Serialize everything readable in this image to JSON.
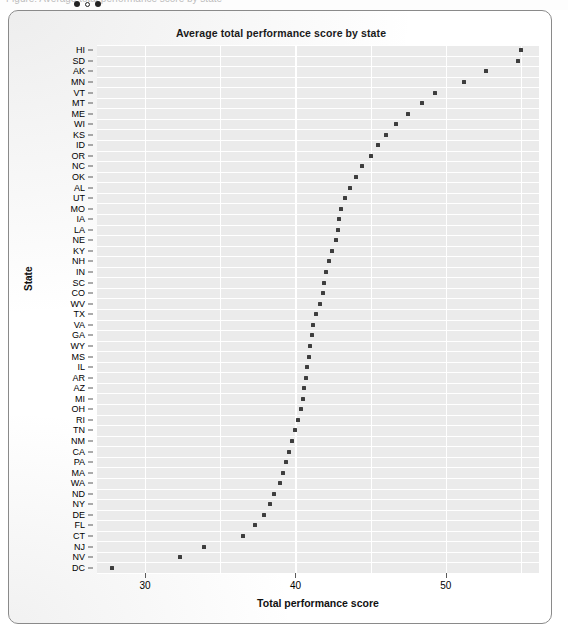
{
  "chrome": {
    "ghost_text": "Figure: Average total performance score by state",
    "dots": [
      "filled",
      "hollow",
      "filled"
    ]
  },
  "chart_data": {
    "type": "scatter",
    "title": "Average total performance score by state",
    "xlabel": "Total performance score",
    "ylabel": "State",
    "xlim": [
      26.8,
      56.2
    ],
    "xticks": [
      30,
      40,
      50
    ],
    "xtick_labels": [
      "30",
      "40",
      "50"
    ],
    "grid": true,
    "legend": null,
    "orientation": "horizontal-dot-plot",
    "categories": [
      "HI",
      "SD",
      "AK",
      "MN",
      "VT",
      "MT",
      "ME",
      "WI",
      "KS",
      "ID",
      "OR",
      "NC",
      "OK",
      "AL",
      "UT",
      "MO",
      "IA",
      "LA",
      "NE",
      "NH",
      "KY",
      "IN",
      "SC",
      "CO",
      "WV",
      "TX",
      "VA",
      "GA",
      "WY",
      "MS",
      "IL",
      "AR",
      "AZ",
      "MI",
      "OH",
      "RI",
      "TN",
      "NM",
      "CA",
      "PA",
      "MA",
      "WA",
      "ND",
      "NY",
      "DE",
      "FL",
      "CT",
      "NJ",
      "NV",
      "DC"
    ],
    "points": [
      {
        "state": "HI",
        "value": 55.0
      },
      {
        "state": "SD",
        "value": 54.8
      },
      {
        "state": "AK",
        "value": 52.7
      },
      {
        "state": "MN",
        "value": 51.2
      },
      {
        "state": "VT",
        "value": 49.3
      },
      {
        "state": "MT",
        "value": 48.4
      },
      {
        "state": "ME",
        "value": 47.5
      },
      {
        "state": "WI",
        "value": 46.7
      },
      {
        "state": "KS",
        "value": 46.0
      },
      {
        "state": "ID",
        "value": 45.5
      },
      {
        "state": "OR",
        "value": 45.0
      },
      {
        "state": "NC",
        "value": 44.4
      },
      {
        "state": "OK",
        "value": 44.0
      },
      {
        "state": "AL",
        "value": 43.6
      },
      {
        "state": "UT",
        "value": 43.3
      },
      {
        "state": "MO",
        "value": 43.0
      },
      {
        "state": "IA",
        "value": 42.9
      },
      {
        "state": "LA",
        "value": 42.8
      },
      {
        "state": "NE",
        "value": 42.7
      },
      {
        "state": "KY",
        "value": 42.4
      },
      {
        "state": "NH",
        "value": 42.2
      },
      {
        "state": "IN",
        "value": 42.0
      },
      {
        "state": "SC",
        "value": 41.9
      },
      {
        "state": "CO",
        "value": 41.8
      },
      {
        "state": "WV",
        "value": 41.6
      },
      {
        "state": "TX",
        "value": 41.4
      },
      {
        "state": "VA",
        "value": 41.2
      },
      {
        "state": "GA",
        "value": 41.1
      },
      {
        "state": "WY",
        "value": 41.0
      },
      {
        "state": "MS",
        "value": 40.9
      },
      {
        "state": "IL",
        "value": 40.8
      },
      {
        "state": "AR",
        "value": 40.7
      },
      {
        "state": "AZ",
        "value": 40.6
      },
      {
        "state": "MI",
        "value": 40.5
      },
      {
        "state": "OH",
        "value": 40.4
      },
      {
        "state": "RI",
        "value": 40.2
      },
      {
        "state": "TN",
        "value": 40.0
      },
      {
        "state": "NM",
        "value": 39.8
      },
      {
        "state": "CA",
        "value": 39.6
      },
      {
        "state": "PA",
        "value": 39.4
      },
      {
        "state": "MA",
        "value": 39.2
      },
      {
        "state": "WA",
        "value": 39.0
      },
      {
        "state": "ND",
        "value": 38.6
      },
      {
        "state": "NY",
        "value": 38.3
      },
      {
        "state": "DE",
        "value": 37.9
      },
      {
        "state": "FL",
        "value": 37.3
      },
      {
        "state": "CT",
        "value": 36.5
      },
      {
        "state": "NJ",
        "value": 33.9
      },
      {
        "state": "NV",
        "value": 32.3
      },
      {
        "state": "DC",
        "value": 27.8
      }
    ]
  }
}
